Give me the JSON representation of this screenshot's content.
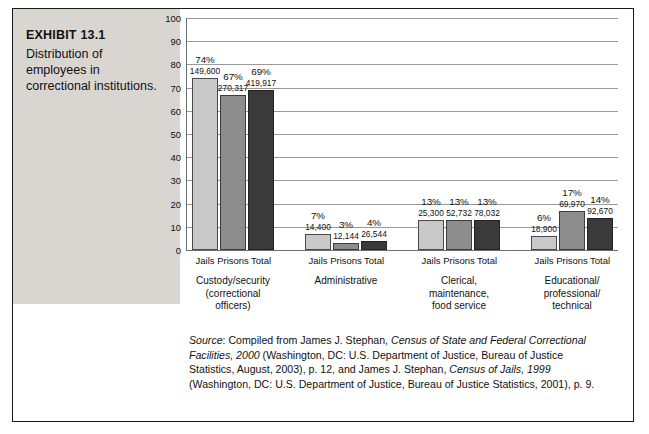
{
  "exhibit": {
    "title": "EXHIBIT 13.1",
    "caption": "Distribution of employees in correctional institutions."
  },
  "chart_data": {
    "type": "bar",
    "title": "Distribution of employees in correctional institutions.",
    "xlabel": "",
    "ylabel": "",
    "ylim": [
      0,
      100
    ],
    "yticks": [
      0,
      10,
      20,
      30,
      40,
      50,
      60,
      70,
      80,
      90,
      100
    ],
    "grid": true,
    "legend": "none",
    "series_labels": [
      "Jails",
      "Prisons",
      "Total"
    ],
    "groups": [
      {
        "name": "Custody/security (correctional officers)",
        "lines": [
          "Custody/security",
          "(correctional",
          "officers)"
        ],
        "bars": [
          {
            "label": "Jails",
            "percent": 74,
            "percent_label": "74%",
            "count": "149,600"
          },
          {
            "label": "Prisons",
            "percent": 67,
            "percent_label": "67%",
            "count": "270,317"
          },
          {
            "label": "Total",
            "percent": 69,
            "percent_label": "69%",
            "count": "419,917"
          }
        ]
      },
      {
        "name": "Administrative",
        "lines": [
          "Administrative"
        ],
        "bars": [
          {
            "label": "Jails",
            "percent": 7,
            "percent_label": "7%",
            "count": "14,400"
          },
          {
            "label": "Prisons",
            "percent": 3,
            "percent_label": "3%",
            "count": "12,144"
          },
          {
            "label": "Total",
            "percent": 4,
            "percent_label": "4%",
            "count": "26,544"
          }
        ]
      },
      {
        "name": "Clerical, maintenance, food service",
        "lines": [
          "Clerical,",
          "maintenance,",
          "food service"
        ],
        "bars": [
          {
            "label": "Jails",
            "percent": 13,
            "percent_label": "13%",
            "count": "25,300"
          },
          {
            "label": "Prisons",
            "percent": 13,
            "percent_label": "13%",
            "count": "52,732"
          },
          {
            "label": "Total",
            "percent": 13,
            "percent_label": "13%",
            "count": "78,032"
          }
        ]
      },
      {
        "name": "Educational/professional/technical",
        "lines": [
          "Educational/",
          "professional/",
          "technical"
        ],
        "bars": [
          {
            "label": "Jails",
            "percent": 6,
            "percent_label": "6%",
            "count": "18,900"
          },
          {
            "label": "Prisons",
            "percent": 17,
            "percent_label": "17%",
            "count": "69,970"
          },
          {
            "label": "Total",
            "percent": 14,
            "percent_label": "14%",
            "count": "92,670"
          }
        ]
      }
    ]
  },
  "source": {
    "lead": "Source",
    "text_1": ": Compiled from James J. Stephan, ",
    "italic_1": "Census of State and Federal Correctional Facilities, 2000",
    "text_2": " (Washington, DC: U.S. Department of Justice, Bureau of Justice Statistics, August, 2003), p. 12, and James J. Stephan, ",
    "italic_2": "Census of Jails, 1999",
    "text_3": " (Washington, DC: U.S. Department of Justice, Bureau of Justice Statistics, 2001), p. 9."
  }
}
